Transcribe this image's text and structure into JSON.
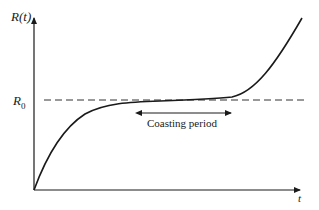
{
  "diagram": {
    "y_axis_label": "R(t)",
    "x_axis_label": "t",
    "reference_level_label": "R",
    "reference_level_subscript": "0",
    "annotation": "Coasting period",
    "colors": {
      "line": "#1a1a1a",
      "dashed_line": "#333333",
      "background": "#ffffff"
    }
  }
}
